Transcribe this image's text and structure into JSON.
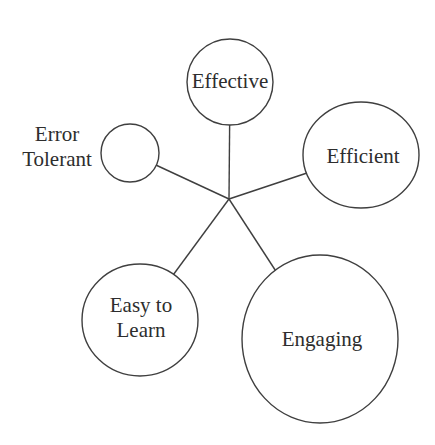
{
  "figure": {
    "background": "#ffffff",
    "stroke_color": "#3f3f3f",
    "text_color": "#2d2d2d",
    "stroke_width": 1.4,
    "line_height": 25,
    "hub": {
      "x": 229,
      "y": 199
    },
    "nodes": [
      {
        "id": "effective",
        "label": "Effective",
        "lines": [
          "Effective"
        ],
        "cx": 230,
        "cy": 82,
        "rx": 43,
        "ry": 43,
        "label_x": 230,
        "label_y": 83,
        "label_inside": true
      },
      {
        "id": "efficient",
        "label": "Efficient",
        "lines": [
          "Efficient"
        ],
        "cx": 361,
        "cy": 155,
        "rx": 58,
        "ry": 53,
        "label_x": 363,
        "label_y": 158,
        "label_inside": true
      },
      {
        "id": "error-tolerant",
        "label": "Error Tolerant",
        "lines": [
          "Error",
          "Tolerant"
        ],
        "cx": 130,
        "cy": 153,
        "rx": 29,
        "ry": 29,
        "label_x": 57,
        "label_y": 149,
        "label_inside": false
      },
      {
        "id": "easy-to-learn",
        "label": "Easy to Learn",
        "lines": [
          "Easy to",
          "Learn"
        ],
        "cx": 140,
        "cy": 320,
        "rx": 58,
        "ry": 56,
        "label_x": 141,
        "label_y": 320,
        "label_inside": true
      },
      {
        "id": "engaging",
        "label": "Engaging",
        "lines": [
          "Engaging"
        ],
        "cx": 320,
        "cy": 339,
        "rx": 78,
        "ry": 84,
        "label_x": 322,
        "label_y": 341,
        "label_inside": true
      }
    ]
  }
}
